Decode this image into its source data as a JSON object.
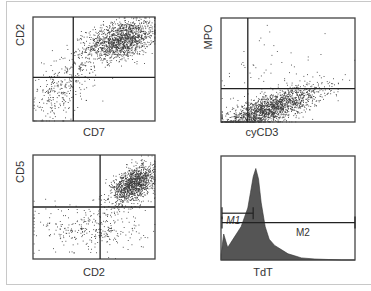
{
  "figure": {
    "colors": {
      "dots": "#3a3a3a",
      "box": "#333333",
      "quadrant": "#222222",
      "histogram_fill": "#555555",
      "frame": "#c8c8c8"
    }
  },
  "chart_data": [
    {
      "type": "scatter",
      "id": "cd7-cd2",
      "xlabel": "CD7",
      "ylabel": "CD2",
      "xlim": [
        0,
        1
      ],
      "ylim": [
        0,
        1
      ],
      "quadrant_gates": {
        "x": 0.33,
        "y": 0.42
      },
      "populations": [
        {
          "name": "main",
          "center": [
            0.72,
            0.78
          ],
          "spread": [
            0.14,
            0.09
          ],
          "count": 1400,
          "tilt": 0.25
        },
        {
          "name": "trailing",
          "center": [
            0.32,
            0.45
          ],
          "spread": [
            0.12,
            0.14
          ],
          "count": 180,
          "tilt": 0.6
        },
        {
          "name": "low",
          "center": [
            0.18,
            0.25
          ],
          "spread": [
            0.1,
            0.14
          ],
          "count": 160,
          "tilt": 0.3
        }
      ]
    },
    {
      "type": "scatter",
      "id": "cycd3-mpo",
      "xlabel": "cyCD3",
      "ylabel": "MPO",
      "xlim": [
        0,
        1
      ],
      "ylim": [
        0,
        1
      ],
      "quadrant_gates": {
        "x": 0.2,
        "y": 0.32
      },
      "populations": [
        {
          "name": "main",
          "center": [
            0.35,
            0.12
          ],
          "spread": [
            0.2,
            0.07
          ],
          "count": 1800,
          "tilt": 0.45
        },
        {
          "name": "sparse-high",
          "center": [
            0.35,
            0.45
          ],
          "spread": [
            0.2,
            0.2
          ],
          "count": 60,
          "tilt": 0.2
        }
      ]
    },
    {
      "type": "scatter",
      "id": "cd2-cd5",
      "xlabel": "CD2",
      "ylabel": "CD5",
      "xlim": [
        0,
        1
      ],
      "ylim": [
        0,
        1
      ],
      "quadrant_gates": {
        "x": 0.55,
        "y": 0.5
      },
      "populations": [
        {
          "name": "main",
          "center": [
            0.82,
            0.72
          ],
          "spread": [
            0.09,
            0.08
          ],
          "count": 1200,
          "tilt": 0.5
        },
        {
          "name": "scatter-low",
          "center": [
            0.5,
            0.3
          ],
          "spread": [
            0.22,
            0.12
          ],
          "count": 320,
          "tilt": 0.0
        }
      ]
    },
    {
      "type": "area",
      "id": "tdt-histogram",
      "xlabel": "TdT",
      "ylabel": "",
      "xlim": [
        0,
        1
      ],
      "ylim": [
        0,
        1
      ],
      "x": [
        0.0,
        0.02,
        0.05,
        0.1,
        0.15,
        0.2,
        0.22,
        0.24,
        0.26,
        0.28,
        0.3,
        0.33,
        0.36,
        0.4,
        0.45,
        0.5,
        0.55,
        0.6,
        0.7,
        0.8,
        0.9,
        1.0
      ],
      "y": [
        0.05,
        0.25,
        0.12,
        0.22,
        0.32,
        0.5,
        0.65,
        0.8,
        0.88,
        0.78,
        0.55,
        0.32,
        0.2,
        0.14,
        0.1,
        0.06,
        0.04,
        0.02,
        0.01,
        0.005,
        0.0,
        0.0
      ],
      "gates": [
        {
          "label": "M1",
          "range": [
            0.0,
            0.24
          ],
          "level": 0.45
        },
        {
          "label": "M2",
          "range": [
            0.0,
            1.0
          ],
          "level": 0.36
        }
      ]
    }
  ]
}
